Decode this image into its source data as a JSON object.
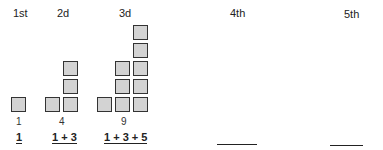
{
  "terms": [
    {
      "label": "1st",
      "value": "1",
      "sum": "1"
    },
    {
      "label": "2d",
      "value": "4",
      "sum": "1 + 3"
    },
    {
      "label": "3d",
      "value": "9",
      "sum": "1 + 3 + 5"
    },
    {
      "label": "4th",
      "value": "",
      "sum": ""
    },
    {
      "label": "5th",
      "value": "",
      "sum": ""
    }
  ],
  "colors": {
    "square_fill": "#d3d3d3",
    "square_border": "#333333"
  }
}
